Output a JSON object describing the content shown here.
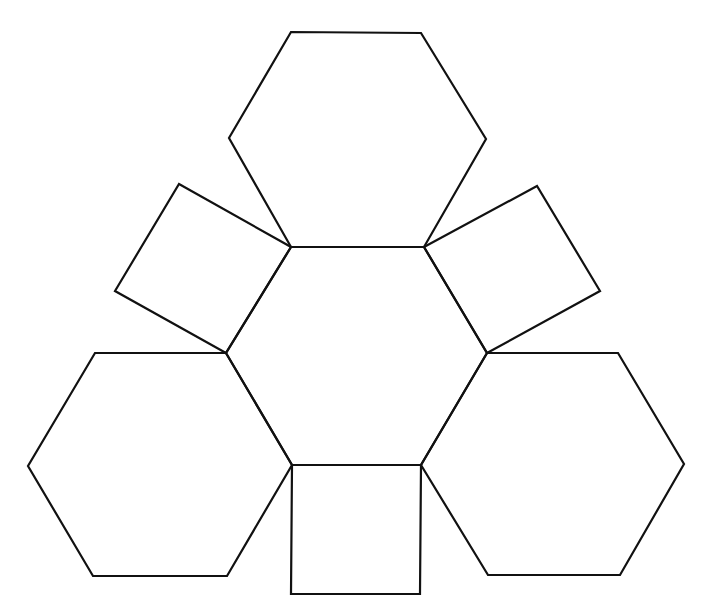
{
  "figure": {
    "width": 709,
    "height": 611,
    "background": "#ffffff",
    "stroke_color": "#111111"
  },
  "shapes": [
    {
      "id": "center-hexagon",
      "type": "hexagon",
      "points": "291,247 424,247 487,353 421,465 292,465 226,353"
    },
    {
      "id": "top-hexagon",
      "type": "hexagon",
      "points": "291,32 421,33 486,139 424,247 291,247 229,138"
    },
    {
      "id": "left-hexagon",
      "type": "hexagon",
      "points": "95,353 226,353 292,465 227,576 93,576 28,466"
    },
    {
      "id": "right-hexagon",
      "type": "hexagon",
      "points": "487,353 618,353 684,464 620,575 488,575 421,465"
    },
    {
      "id": "upper-left-square",
      "type": "square",
      "points": "179,184 291,247 226,353 115,291"
    },
    {
      "id": "upper-right-square",
      "type": "square",
      "points": "424,247 537,186 600,291 487,353"
    },
    {
      "id": "bottom-square",
      "type": "square",
      "points": "292,465 421,465 420,594 291,594"
    }
  ]
}
